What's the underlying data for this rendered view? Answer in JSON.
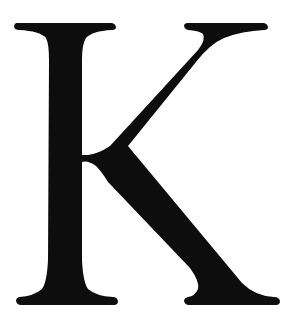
{
  "glyph": {
    "character": "K",
    "style": "serif capital letter",
    "fill_color": "#0d0d0d",
    "background_color": "#ffffff"
  }
}
